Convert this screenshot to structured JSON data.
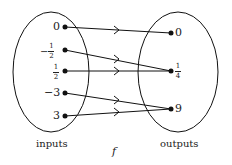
{
  "diagram": {
    "function_label": "f",
    "inputs_label": "inputs",
    "outputs_label": "outputs",
    "inputs": [
      {
        "label": "0",
        "num": "",
        "den": "",
        "sign": ""
      },
      {
        "label": "-1/2",
        "num": "1",
        "den": "2",
        "sign": "−"
      },
      {
        "label": "1/2",
        "num": "1",
        "den": "2",
        "sign": ""
      },
      {
        "label": "-3",
        "num": "",
        "den": "",
        "sign": ""
      },
      {
        "label": "3",
        "num": "",
        "den": "",
        "sign": ""
      }
    ],
    "input_text": [
      "0",
      "",
      "",
      "−3",
      "3"
    ],
    "outputs": [
      {
        "label": "0"
      },
      {
        "label": "1/4",
        "num": "1",
        "den": "4"
      },
      {
        "label": "9"
      }
    ],
    "output_text": [
      "0",
      "",
      "9"
    ],
    "mappings": [
      {
        "from": "0",
        "to": "0"
      },
      {
        "from": "-1/2",
        "to": "1/4"
      },
      {
        "from": "1/2",
        "to": "1/4"
      },
      {
        "from": "-3",
        "to": "9"
      },
      {
        "from": "3",
        "to": "9"
      }
    ]
  }
}
